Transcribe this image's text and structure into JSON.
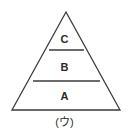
{
  "figure": {
    "type": "pyramid-diagram",
    "caption": "(ウ)",
    "background_color": "#ffffff",
    "stroke_color": "#3a3a3a",
    "fill_color": "#ffffff",
    "text_color": "#2b2b2b",
    "tiers": [
      {
        "id": "c",
        "label": "C",
        "position": "top"
      },
      {
        "id": "b",
        "label": "B",
        "position": "middle"
      },
      {
        "id": "a",
        "label": "A",
        "position": "bottom"
      }
    ],
    "geometry": {
      "apex": {
        "x": 66,
        "y": 12
      },
      "base_left": {
        "x": 12,
        "y": 110
      },
      "base_right": {
        "x": 120,
        "y": 110
      },
      "divider_upper": {
        "y": 50,
        "x_start": 49,
        "x_end": 84
      },
      "divider_lower": {
        "y": 81,
        "x_start": 33,
        "x_end": 100
      }
    }
  }
}
